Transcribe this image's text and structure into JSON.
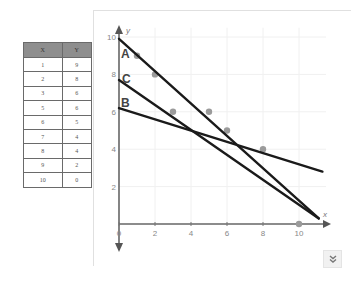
{
  "table": {
    "headers": [
      "X",
      "Y"
    ],
    "rows": [
      [
        "1",
        "9"
      ],
      [
        "2",
        "8"
      ],
      [
        "3",
        "6"
      ],
      [
        "5",
        "6"
      ],
      [
        "6",
        "5"
      ],
      [
        "7",
        "4"
      ],
      [
        "8",
        "4"
      ],
      [
        "9",
        "2"
      ],
      [
        "10",
        "0"
      ]
    ]
  },
  "chart_data": {
    "type": "scatter",
    "title": "",
    "xlabel": "x",
    "ylabel": "y",
    "xlim": [
      0,
      11
    ],
    "ylim": [
      0,
      10
    ],
    "x_ticks": [
      "0",
      "2",
      "4",
      "6",
      "8",
      "10"
    ],
    "y_ticks": [
      "2",
      "4",
      "6",
      "8",
      "10"
    ],
    "grid": true,
    "points": {
      "x": [
        1,
        2,
        3,
        5,
        6,
        8,
        10
      ],
      "y": [
        9,
        8,
        6,
        6,
        5,
        4,
        0
      ]
    },
    "lines": [
      {
        "name": "A",
        "x": [
          0,
          11.1
        ],
        "y": [
          9.9,
          0.3
        ]
      },
      {
        "name": "C",
        "x": [
          0,
          11.1
        ],
        "y": [
          7.7,
          0.3
        ]
      },
      {
        "name": "B",
        "x": [
          0,
          11.3
        ],
        "y": [
          6.2,
          2.8
        ]
      }
    ],
    "colors": {
      "points": "#9a9a9a",
      "lines": "#1a1a1a",
      "axes": "#666666"
    }
  },
  "controls": {
    "expand_button_icon": "double-chevron-down"
  }
}
